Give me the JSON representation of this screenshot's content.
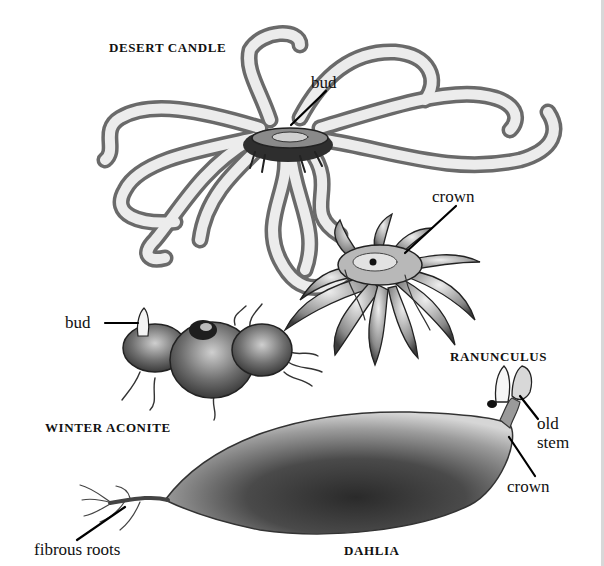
{
  "figure": {
    "background": "#ffffff",
    "ink_color": "#111111",
    "plants": [
      {
        "id": "desert-candle",
        "name": "DESERT CANDLE",
        "parts": [
          {
            "label": "bud"
          }
        ]
      },
      {
        "id": "ranunculus",
        "name": "RANUNCULUS",
        "parts": [
          {
            "label": "crown"
          }
        ]
      },
      {
        "id": "winter-aconite",
        "name": "WINTER ACONITE",
        "parts": [
          {
            "label": "bud"
          }
        ]
      },
      {
        "id": "dahlia",
        "name": "DAHLIA",
        "parts": [
          {
            "label": "old"
          },
          {
            "label": "stem"
          },
          {
            "label": "crown"
          },
          {
            "label": "fibrous roots"
          }
        ]
      }
    ]
  }
}
